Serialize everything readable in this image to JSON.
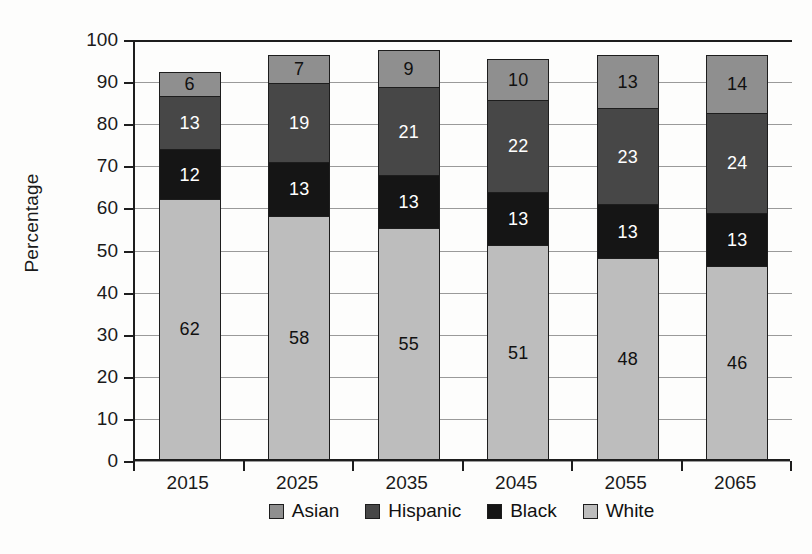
{
  "chart_data": {
    "type": "bar",
    "subtype": "stacked-bar",
    "title": "",
    "xlabel": "",
    "ylabel": "Percentage",
    "ylim": [
      0,
      100
    ],
    "yticks": [
      0,
      10,
      20,
      30,
      40,
      50,
      60,
      70,
      80,
      90,
      100
    ],
    "grid": true,
    "legend_position": "bottom",
    "categories": [
      "2015",
      "2025",
      "2035",
      "2045",
      "2055",
      "2065"
    ],
    "stack_order_bottom_to_top": [
      "White",
      "Black",
      "Hispanic",
      "Asian"
    ],
    "series": [
      {
        "name": "White",
        "color": "#bdbdbd",
        "values": [
          62,
          58,
          55,
          51,
          48,
          46
        ]
      },
      {
        "name": "Black",
        "color": "#151515",
        "values": [
          12,
          13,
          13,
          13,
          13,
          13
        ]
      },
      {
        "name": "Hispanic",
        "color": "#474747",
        "values": [
          13,
          19,
          21,
          22,
          23,
          24
        ]
      },
      {
        "name": "Asian",
        "color": "#8f8f8f",
        "values": [
          6,
          7,
          9,
          10,
          13,
          14
        ]
      }
    ],
    "stack_totals": [
      93,
      97,
      98,
      96,
      97,
      97
    ]
  },
  "axes": {
    "y_title": "Percentage",
    "y_tick_labels": [
      "100",
      "90",
      "80",
      "70",
      "60",
      "50",
      "40",
      "30",
      "20",
      "10",
      "0"
    ],
    "x_tick_labels": [
      "2015",
      "2025",
      "2035",
      "2045",
      "2055",
      "2065"
    ]
  },
  "legend": {
    "items": [
      {
        "label": "Asian",
        "color": "#8f8f8f"
      },
      {
        "label": "Hispanic",
        "color": "#474747"
      },
      {
        "label": "Black",
        "color": "#151515"
      },
      {
        "label": "White",
        "color": "#bdbdbd"
      }
    ]
  },
  "bar_labels": {
    "2015": {
      "White": "62",
      "Black": "12",
      "Hispanic": "13",
      "Asian": "6"
    },
    "2025": {
      "White": "58",
      "Black": "13",
      "Hispanic": "19",
      "Asian": "7"
    },
    "2035": {
      "White": "55",
      "Black": "13",
      "Hispanic": "21",
      "Asian": "9"
    },
    "2045": {
      "White": "51",
      "Black": "13",
      "Hispanic": "22",
      "Asian": "10"
    },
    "2055": {
      "White": "48",
      "Black": "13",
      "Hispanic": "23",
      "Asian": "13"
    },
    "2065": {
      "White": "46",
      "Black": "13",
      "Hispanic": "24",
      "Asian": "14"
    }
  },
  "colors": {
    "asian": "#8f8f8f",
    "hispanic": "#474747",
    "black": "#151515",
    "white": "#bdbdbd",
    "axis": "#1d1d1d",
    "grid": "#9a9a9a",
    "background": "#fdfdfc"
  }
}
